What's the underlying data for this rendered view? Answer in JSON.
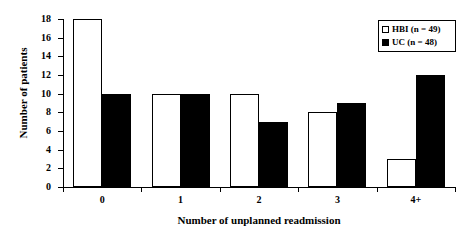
{
  "chart_data": {
    "type": "bar",
    "title": "",
    "xlabel": "Number of  unplanned  readmission",
    "ylabel": "Number of patients",
    "categories": [
      "0",
      "1",
      "2",
      "3",
      "4+"
    ],
    "series": [
      {
        "name": "HBI  (n = 49)",
        "short_name": "HBI",
        "values": [
          18,
          10,
          10,
          8,
          3
        ],
        "color": "#ffffff",
        "edge_color": "#000000",
        "swatch": "open"
      },
      {
        "name": "UC  (n = 48)",
        "short_name": "UC",
        "values": [
          10,
          10,
          7,
          9,
          12
        ],
        "color": "#000000",
        "edge_color": "#000000",
        "swatch": "filled"
      }
    ],
    "ylim": [
      0,
      18
    ],
    "yticks": [
      0,
      2,
      4,
      6,
      8,
      10,
      12,
      14,
      16,
      18
    ],
    "ytick_labels": [
      "0",
      "2",
      "4",
      "6",
      "8",
      "10",
      "12",
      "14",
      "16",
      "18"
    ],
    "grid": false,
    "legend_position": "top-right",
    "legend": [
      {
        "label": "HBI  (n = 49)",
        "swatch": "open"
      },
      {
        "label": "UC  (n = 48)",
        "swatch": "filled"
      }
    ]
  }
}
